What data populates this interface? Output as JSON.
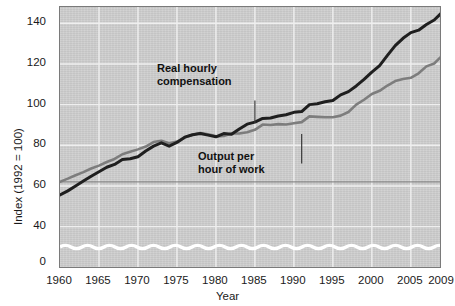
{
  "chart_data": {
    "type": "line",
    "title": "",
    "xlabel": "Year",
    "ylabel": "Index (1992 = 100)",
    "xlim": [
      1960,
      2009
    ],
    "ylim": [
      0,
      148
    ],
    "y_break": true,
    "y_break_note": "axis broken between 0 and ~30",
    "grid": true,
    "grid_color": "#efefef",
    "panel_color": "#cfcfcf",
    "legend": "in-plot annotations with leader lines",
    "yticks": [
      0,
      40,
      60,
      80,
      100,
      120,
      140
    ],
    "ytick_labels": [
      "0",
      "40",
      "60",
      "80",
      "100",
      "120",
      "140"
    ],
    "xticks": [
      1960,
      1965,
      1970,
      1975,
      1980,
      1985,
      1990,
      1995,
      2000,
      2005,
      2009
    ],
    "xtick_labels": [
      "1960",
      "1965",
      "1970",
      "1975",
      "1980",
      "1985",
      "1990",
      "1995",
      "2000",
      "2005",
      "2009"
    ],
    "reference_line": {
      "y": 62,
      "color": "#808080"
    },
    "annotations": [
      {
        "id": "real-hourly-compensation",
        "line1": "Real hourly",
        "line2": "compensation",
        "leader": {
          "x": 1985.0,
          "y_from": 102.0,
          "y_to": 91.0
        },
        "color": "#808080"
      },
      {
        "id": "output-per-hour-of-work",
        "line1": "Output per",
        "line2": "hour of work",
        "leader": {
          "x": 1991.0,
          "y_from": 85.5,
          "y_to": 71.0
        },
        "color": "#1a1a1a"
      }
    ],
    "series": [
      {
        "name": "Real hourly compensation",
        "color": "#7d7d7d",
        "width": 2.6,
        "x": [
          1960,
          1961,
          1962,
          1963,
          1964,
          1965,
          1966,
          1967,
          1968,
          1969,
          1970,
          1971,
          1972,
          1973,
          1974,
          1975,
          1976,
          1977,
          1978,
          1979,
          1980,
          1981,
          1982,
          1983,
          1984,
          1985,
          1986,
          1987,
          1988,
          1989,
          1990,
          1991,
          1992,
          1993,
          1994,
          1995,
          1996,
          1997,
          1998,
          1999,
          2000,
          2001,
          2002,
          2003,
          2004,
          2005,
          2006,
          2007,
          2008,
          2009
        ],
        "values": [
          62.0,
          63.6,
          65.3,
          66.8,
          68.6,
          70.0,
          71.8,
          73.3,
          75.6,
          76.8,
          78.0,
          79.4,
          81.6,
          82.2,
          81.0,
          81.8,
          83.8,
          85.2,
          86.0,
          85.4,
          84.4,
          84.6,
          85.8,
          85.8,
          86.4,
          87.6,
          90.2,
          90.0,
          90.4,
          90.2,
          90.8,
          91.4,
          94.2,
          94.0,
          93.8,
          93.8,
          94.6,
          96.4,
          100.0,
          102.4,
          105.2,
          106.8,
          109.4,
          111.6,
          112.6,
          113.2,
          115.4,
          118.8,
          120.2,
          124.0
        ]
      },
      {
        "name": "Output per hour of work",
        "color": "#1f1f1f",
        "width": 3.0,
        "x": [
          1960,
          1961,
          1962,
          1963,
          1964,
          1965,
          1966,
          1967,
          1968,
          1969,
          1970,
          1971,
          1972,
          1973,
          1974,
          1975,
          1976,
          1977,
          1978,
          1979,
          1980,
          1981,
          1982,
          1983,
          1984,
          1985,
          1986,
          1987,
          1988,
          1989,
          1990,
          1991,
          1992,
          1993,
          1994,
          1995,
          1996,
          1997,
          1998,
          1999,
          2000,
          2001,
          2002,
          2003,
          2004,
          2005,
          2006,
          2007,
          2008,
          2009
        ],
        "values": [
          55.6,
          57.6,
          60.0,
          62.4,
          64.8,
          67.0,
          69.2,
          70.6,
          73.0,
          73.4,
          74.4,
          77.2,
          79.6,
          81.2,
          79.6,
          81.4,
          84.0,
          85.2,
          85.8,
          85.0,
          84.2,
          85.8,
          85.4,
          88.0,
          90.4,
          91.4,
          93.2,
          93.4,
          94.4,
          95.0,
          96.2,
          96.6,
          100.0,
          100.4,
          101.4,
          102.0,
          104.8,
          106.4,
          109.2,
          112.4,
          116.0,
          119.2,
          124.2,
          129.0,
          132.6,
          135.4,
          136.6,
          139.4,
          141.6,
          145.4
        ]
      }
    ]
  }
}
